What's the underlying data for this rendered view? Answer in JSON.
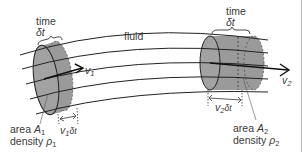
{
  "diagram": {
    "type": "fluid-flow-tube",
    "medium_label": "fluid",
    "colors": {
      "line": "#222222",
      "cylinder_fill": "#9a9a9a",
      "text": "#3a3a3a",
      "border": "#b8b8b8"
    },
    "section_1": {
      "time_label": "time",
      "time_symbol": "δt",
      "velocity_symbol": "v",
      "velocity_sub": "1",
      "displacement_sym": "v",
      "displacement_sub": "1",
      "displacement_tail": "δt",
      "area_word": "area",
      "area_symbol": "A",
      "area_sub": "1",
      "density_word": "density",
      "density_symbol": "ρ",
      "density_sub": "1"
    },
    "section_2": {
      "time_label": "time",
      "time_symbol": "δt",
      "velocity_symbol": "v",
      "velocity_sub": "2",
      "displacement_sym": "v",
      "displacement_sub": "2",
      "displacement_tail": "δt",
      "area_word": "area",
      "area_symbol": "A",
      "area_sub": "2",
      "density_word": "density",
      "density_symbol": "ρ",
      "density_sub": "2"
    }
  }
}
